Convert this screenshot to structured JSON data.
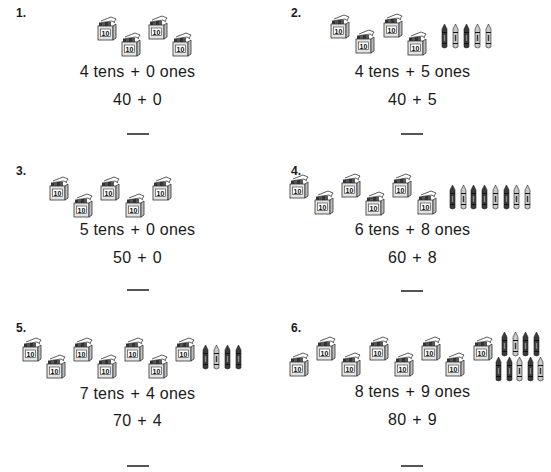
{
  "problems": [
    {
      "number": "1.",
      "tens": 4,
      "ones": 0,
      "tens_text": "4 tens",
      "ones_text": "0 ones",
      "plus": "+",
      "tens_value": "40",
      "ones_value": "0",
      "answer": "",
      "boxes": [
        [
          97,
          14
        ],
        [
          121,
          30
        ],
        [
          148,
          13
        ],
        [
          172,
          30
        ]
      ],
      "crayons": []
    },
    {
      "number": "2.",
      "tens": 4,
      "ones": 5,
      "tens_text": "4 tens",
      "ones_text": "5 ones",
      "plus": "+",
      "tens_value": "40",
      "ones_value": "5",
      "answer": "",
      "boxes": [
        [
          55,
          12
        ],
        [
          80,
          27
        ],
        [
          108,
          11
        ],
        [
          132,
          29
        ]
      ],
      "crayons": [
        [
          166,
          24
        ],
        [
          177,
          24
        ],
        [
          188,
          24
        ],
        [
          199,
          24
        ],
        [
          210,
          24
        ]
      ]
    },
    {
      "number": "3.",
      "tens": 5,
      "ones": 0,
      "tens_text": "5 tens",
      "ones_text": "0 ones",
      "plus": "+",
      "tens_value": "50",
      "ones_value": "0",
      "answer": "",
      "boxes": [
        [
          49,
          16
        ],
        [
          73,
          33
        ],
        [
          100,
          16
        ],
        [
          125,
          33
        ],
        [
          152,
          16
        ]
      ],
      "crayons": []
    },
    {
      "number": "4.",
      "tens": 6,
      "ones": 8,
      "tens_text": "6 tens",
      "ones_text": "8 ones",
      "plus": "+",
      "tens_value": "60",
      "ones_value": "8",
      "answer": "",
      "boxes": [
        [
          14,
          14
        ],
        [
          39,
          30
        ],
        [
          66,
          13
        ],
        [
          90,
          31
        ],
        [
          117,
          13
        ],
        [
          142,
          30
        ]
      ],
      "crayons": [
        [
          174,
          27
        ],
        [
          185,
          27
        ],
        [
          195,
          27
        ],
        [
          206,
          27
        ],
        [
          217,
          27
        ],
        [
          228,
          27
        ],
        [
          238,
          27
        ],
        [
          249,
          27
        ]
      ]
    },
    {
      "number": "5.",
      "tens": 7,
      "ones": 4,
      "tens_text": "7 tens",
      "ones_text": "4 ones",
      "plus": "+",
      "tens_value": "70",
      "ones_value": "4",
      "answer": "",
      "boxes": [
        [
          22,
          20
        ],
        [
          46,
          37
        ],
        [
          73,
          20
        ],
        [
          97,
          37
        ],
        [
          124,
          20
        ],
        [
          148,
          37
        ],
        [
          175,
          20
        ]
      ],
      "crayons": [
        [
          202,
          30
        ],
        [
          213,
          30
        ],
        [
          224,
          30
        ],
        [
          235,
          30
        ]
      ]
    },
    {
      "number": "6.",
      "tens": 8,
      "ones": 9,
      "tens_text": "8 tens",
      "ones_text": "9 ones",
      "plus": "+",
      "tens_value": "80",
      "ones_value": "9",
      "answer": "",
      "boxes": [
        [
          14,
          35
        ],
        [
          41,
          19
        ],
        [
          66,
          35
        ],
        [
          94,
          19
        ],
        [
          119,
          35
        ],
        [
          146,
          19
        ],
        [
          170,
          35
        ],
        [
          198,
          19
        ]
      ],
      "crayons": [
        [
          226,
          17
        ],
        [
          237,
          17
        ],
        [
          247,
          17
        ],
        [
          258,
          17
        ],
        [
          220,
          42
        ],
        [
          231,
          42
        ],
        [
          241,
          42
        ],
        [
          252,
          42
        ],
        [
          262,
          42
        ]
      ]
    }
  ],
  "icons": {
    "box_label": "10"
  },
  "colors": {
    "ink": "#1a1a1a",
    "box_fill": "#e6e6e6",
    "box_shade": "#bdbdbd",
    "crayon_dark": "#444444",
    "crayon_light": "#bbbbbb"
  }
}
